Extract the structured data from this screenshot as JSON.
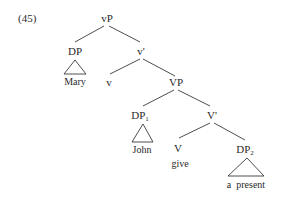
{
  "example_number": "(45)",
  "tree": {
    "root": {
      "label": "vP"
    },
    "spec_vP": {
      "label": "DP",
      "leaf": "Mary"
    },
    "v_bar": {
      "label": "v'"
    },
    "v_head": {
      "label": "v"
    },
    "VP": {
      "label": "VP"
    },
    "spec_VP": {
      "label": "DP",
      "subscript": "1",
      "leaf": "John"
    },
    "V_bar": {
      "label": "V'"
    },
    "V_head": {
      "label": "V",
      "leaf": "give"
    },
    "complement": {
      "label": "DP",
      "subscript": "2",
      "leaf": "a  present"
    }
  },
  "colors": {
    "ink": "#2a2a2a",
    "lines": "#3a3a3a",
    "background": "#ffffff"
  }
}
